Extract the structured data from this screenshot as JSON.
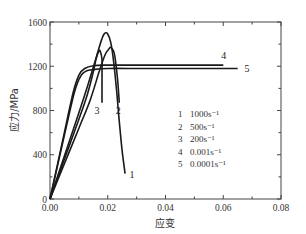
{
  "chart_data": {
    "type": "line",
    "title": "",
    "xlabel": "应变",
    "ylabel": "应力/MPa",
    "xlim": [
      0.0,
      0.08
    ],
    "ylim": [
      0,
      1600
    ],
    "xticks": [
      0.0,
      0.02,
      0.04,
      0.06,
      0.08
    ],
    "xtick_labels": [
      "0.00",
      "0.02",
      "0.04",
      "0.06",
      "0.08"
    ],
    "yticks": [
      0,
      400,
      800,
      1200,
      1600
    ],
    "ytick_labels": [
      "0",
      "400",
      "800",
      "1200",
      "1600"
    ],
    "grid": false,
    "legend_position": "inside-right",
    "legend": [
      {
        "id": "1",
        "rate": "1000s⁻¹"
      },
      {
        "id": "2",
        "rate": "500s⁻¹"
      },
      {
        "id": "3",
        "rate": "200s⁻¹"
      },
      {
        "id": "4",
        "rate": "0.001s⁻¹"
      },
      {
        "id": "5",
        "rate": "0.0001s⁻¹"
      }
    ],
    "series": [
      {
        "name": "1",
        "label": "1000s⁻¹",
        "x": [
          0.0,
          0.005,
          0.01,
          0.013,
          0.016,
          0.018,
          0.019,
          0.02,
          0.021,
          0.022,
          0.023,
          0.024,
          0.025,
          0.026
        ],
        "y": [
          0,
          390,
          780,
          1020,
          1280,
          1450,
          1500,
          1490,
          1420,
          1250,
          1000,
          700,
          430,
          230
        ]
      },
      {
        "name": "2",
        "label": "500s⁻¹",
        "x": [
          0.0,
          0.005,
          0.01,
          0.014,
          0.017,
          0.019,
          0.0205,
          0.021,
          0.022,
          0.0225,
          0.023,
          0.0235,
          0.024
        ],
        "y": [
          0,
          320,
          640,
          900,
          1150,
          1300,
          1360,
          1370,
          1340,
          1280,
          1180,
          1050,
          870
        ]
      },
      {
        "name": "3",
        "label": "200s⁻¹",
        "x": [
          0.0,
          0.005,
          0.01,
          0.013,
          0.015,
          0.016,
          0.017,
          0.0175,
          0.018,
          0.018,
          0.018
        ],
        "y": [
          0,
          360,
          720,
          950,
          1150,
          1270,
          1340,
          1330,
          1260,
          1100,
          870
        ]
      },
      {
        "name": "4",
        "label": "0.001s⁻¹",
        "x": [
          0.0,
          0.004,
          0.008,
          0.01,
          0.012,
          0.015,
          0.02,
          0.03,
          0.04,
          0.05,
          0.06
        ],
        "y": [
          0,
          480,
          960,
          1120,
          1180,
          1205,
          1210,
          1210,
          1210,
          1210,
          1210
        ]
      },
      {
        "name": "5",
        "label": "0.0001s⁻¹",
        "x": [
          0.0,
          0.004,
          0.008,
          0.01,
          0.012,
          0.015,
          0.02,
          0.03,
          0.04,
          0.05,
          0.06,
          0.065
        ],
        "y": [
          0,
          460,
          920,
          1080,
          1150,
          1170,
          1180,
          1180,
          1180,
          1180,
          1180,
          1180
        ]
      }
    ],
    "curve_labels": [
      {
        "text": "1",
        "x": 0.0265,
        "y": 230
      },
      {
        "text": "2",
        "x": 0.0235,
        "y": 870
      },
      {
        "text": "3",
        "x": 0.0175,
        "y": 870
      },
      {
        "text": "4",
        "x": 0.06,
        "y": 1240
      },
      {
        "text": "5",
        "x": 0.066,
        "y": 1180
      }
    ]
  }
}
